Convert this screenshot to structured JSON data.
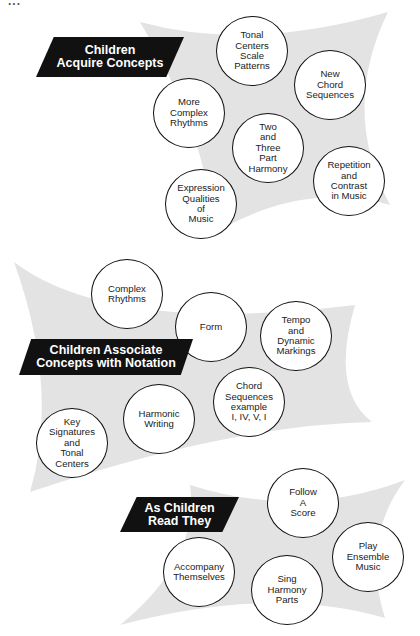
{
  "header": {
    "cropped_text": "..."
  },
  "sections": [
    {
      "id": "acquire",
      "banner": {
        "lines": [
          "Children",
          "Acquire Concepts"
        ]
      },
      "nodes": [
        {
          "lines": [
            "Tonal",
            "Centers",
            "Scale",
            "Patterns"
          ]
        },
        {
          "lines": [
            "New",
            "Chord",
            "Sequences"
          ]
        },
        {
          "lines": [
            "More",
            "Complex",
            "Rhythms"
          ]
        },
        {
          "lines": [
            "Two",
            "and",
            "Three",
            "Part",
            "Harmony"
          ]
        },
        {
          "lines": [
            "Repetition",
            "and",
            "Contrast",
            "in Music"
          ]
        },
        {
          "lines": [
            "Expression",
            "Qualities",
            "of",
            "Music"
          ]
        }
      ]
    },
    {
      "id": "associate",
      "banner": {
        "lines": [
          "Children Associate",
          "Concepts with Notation"
        ]
      },
      "nodes": [
        {
          "lines": [
            "Complex",
            "Rhythms"
          ]
        },
        {
          "lines": [
            "Form"
          ]
        },
        {
          "lines": [
            "Tempo",
            "and",
            "Dynamic",
            "Markings"
          ]
        },
        {
          "lines": [
            "Chord",
            "Sequences",
            "example",
            "I, IV, V, I"
          ]
        },
        {
          "lines": [
            "Harmonic",
            "Writing"
          ]
        },
        {
          "lines": [
            "Key",
            "Signatures",
            "and",
            "Tonal",
            "Centers"
          ]
        }
      ]
    },
    {
      "id": "read",
      "banner": {
        "lines": [
          "As Children",
          "Read They"
        ]
      },
      "nodes": [
        {
          "lines": [
            "Follow",
            "A",
            "Score"
          ]
        },
        {
          "lines": [
            "Play",
            "Ensemble",
            "Music"
          ]
        },
        {
          "lines": [
            "Accompany",
            "Themselves"
          ]
        },
        {
          "lines": [
            "Sing",
            "Harmony",
            "Parts"
          ]
        }
      ]
    }
  ],
  "colors": {
    "banner_bg": "#111111",
    "banner_text": "#ffffff",
    "shape_fill": "#e3e3e3",
    "circle_border": "#111111"
  }
}
